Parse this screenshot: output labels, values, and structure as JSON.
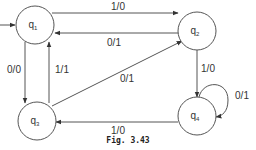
{
  "diagram": {
    "type": "finite-state-machine (Mealy)",
    "caption": "Fig. 3.43",
    "colors": {
      "stroke": "#555555",
      "text": "#333333",
      "background": "#ffffff"
    },
    "start_state": "q1",
    "states": [
      {
        "id": "q1",
        "label": "q",
        "sub": "1",
        "cx": 35,
        "cy": 25
      },
      {
        "id": "q2",
        "label": "q",
        "sub": "2",
        "cx": 197,
        "cy": 31
      },
      {
        "id": "q3",
        "label": "q",
        "sub": "3",
        "cx": 37,
        "cy": 121
      },
      {
        "id": "q4",
        "label": "q",
        "sub": "4",
        "cx": 197,
        "cy": 116
      }
    ],
    "transitions": [
      {
        "from": "q1",
        "to": "q2",
        "label": "1/0"
      },
      {
        "from": "q2",
        "to": "q1",
        "label": "0/1"
      },
      {
        "from": "q1",
        "to": "q3",
        "label": "0/0"
      },
      {
        "from": "q3",
        "to": "q1",
        "label": "1/1"
      },
      {
        "from": "q3",
        "to": "q2",
        "label": "0/1"
      },
      {
        "from": "q2",
        "to": "q4",
        "label": "1/0"
      },
      {
        "from": "q4",
        "to": "q4",
        "label": "0/1"
      },
      {
        "from": "q4",
        "to": "q3",
        "label": "1/0"
      }
    ]
  }
}
